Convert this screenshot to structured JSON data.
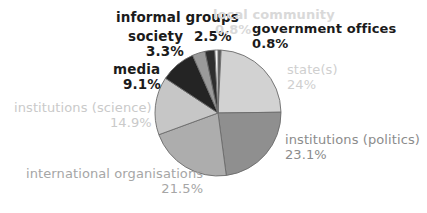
{
  "chart_data": {
    "type": "pie",
    "title": "",
    "subtitle": "",
    "xlabel": "",
    "ylabel": "",
    "legend_position": "none",
    "grid": false,
    "labels_show_percent": true,
    "start_angle_deg": 0,
    "direction": "clockwise",
    "categories": [
      "government offices",
      "state(s)",
      "institutions (politics)",
      "international organisations",
      "institutions (science)",
      "media",
      "society",
      "informal groups",
      "local community"
    ],
    "values": [
      0.8,
      24,
      23.1,
      21.5,
      14.9,
      9.1,
      3.3,
      2.5,
      0.8
    ],
    "value_labels": [
      "0.8%",
      "24%",
      "23.1%",
      "21.5%",
      "14.9%",
      "9.1%",
      "3.3%",
      "2.5%",
      "0.8%"
    ],
    "slice_colors": [
      "#5a5a5a",
      "#d2d2d2",
      "#8f8f8f",
      "#adadad",
      "#c6c6c6",
      "#242424",
      "#9a9a9a",
      "#2e2e2e",
      "#f4f4f4"
    ],
    "label_text_colors": [
      "#1b1b1b",
      "#cfcfcf",
      "#8c8c8c",
      "#a6a6a6",
      "#cacaca",
      "#1b1b1b",
      "#1b1b1b",
      "#1b1b1b",
      "#d9d9d9"
    ]
  },
  "labels": {
    "government_offices": {
      "name": "government offices",
      "pct": "0.8%"
    },
    "states": {
      "name": "state(s)",
      "pct": "24%"
    },
    "institutions_politics": {
      "name": "institutions (politics)",
      "pct": "23.1%"
    },
    "international_organisations": {
      "name": "international organisations",
      "pct": "21.5%"
    },
    "institutions_science": {
      "name": "institutions (science)",
      "pct": "14.9%"
    },
    "media": {
      "name": "media",
      "pct": "9.1%"
    },
    "society": {
      "name": "society",
      "pct": "3.3%"
    },
    "informal_groups": {
      "name": "informal groups",
      "pct": "2.5%"
    },
    "local_community": {
      "name": "local community",
      "pct": "0.8%"
    }
  },
  "geometry": {
    "center_x": 218,
    "center_y": 113,
    "radius": 63,
    "stroke_color": "#6b6b6b",
    "background": "#ffffff"
  }
}
